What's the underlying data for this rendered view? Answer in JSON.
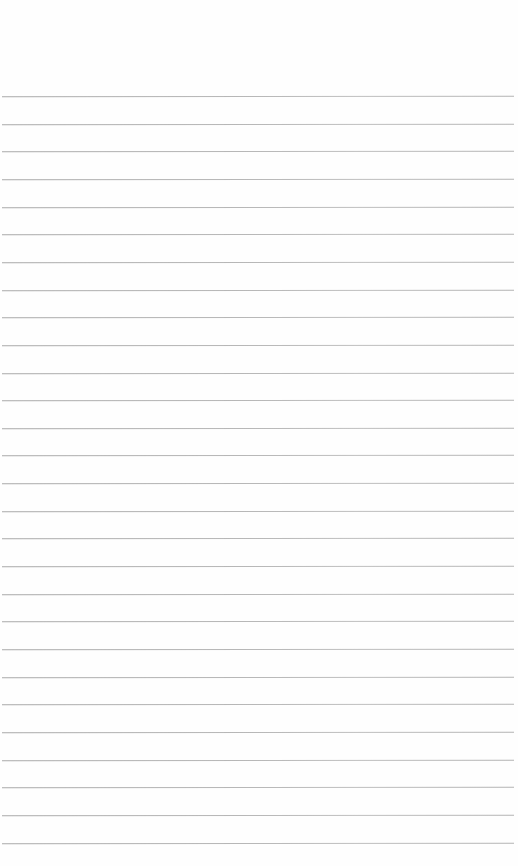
{
  "page": {
    "type": "ruled-paper",
    "background_color": "#fefefe",
    "line_color": "#a8a8a8",
    "first_line_y": 96,
    "line_spacing": 27.65,
    "line_count": 28,
    "text": ""
  }
}
